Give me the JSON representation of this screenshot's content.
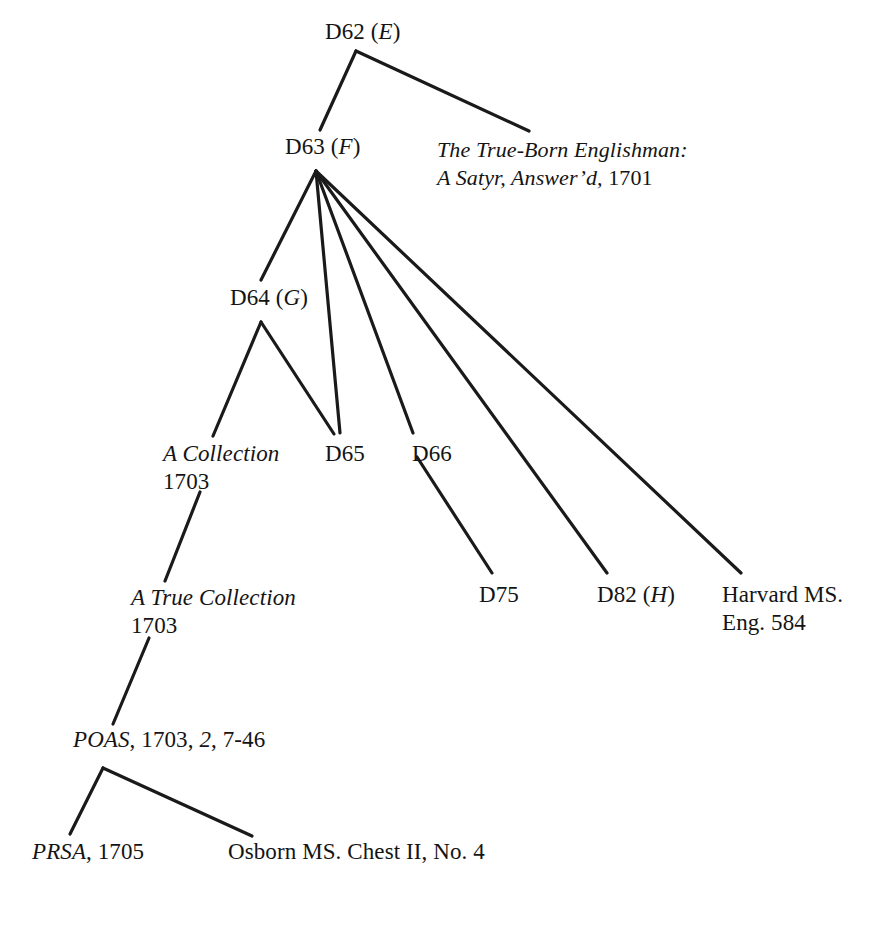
{
  "diagram": {
    "type": "stemma",
    "background_color": "#ffffff",
    "line_color": "#1a1a1a",
    "text_color": "#141414",
    "nodes": [
      {
        "id": "d62",
        "name": "node-d62",
        "lines": [
          {
            "parts": [
              {
                "text": "D62 (",
                "style": "roman"
              },
              {
                "text": "E",
                "style": "italic"
              },
              {
                "text": ")",
                "style": "roman"
              }
            ]
          }
        ],
        "plain": "D62 (E)",
        "x": 325,
        "y": 18
      },
      {
        "id": "d63",
        "name": "node-d63",
        "lines": [
          {
            "parts": [
              {
                "text": "D63 (",
                "style": "roman"
              },
              {
                "text": "F",
                "style": "italic"
              },
              {
                "text": ")",
                "style": "roman"
              }
            ]
          }
        ],
        "plain": "D63 (F)",
        "x": 285,
        "y": 133
      },
      {
        "id": "trueborn",
        "name": "node-true-born-englishman",
        "lines": [
          {
            "parts": [
              {
                "text": "The True-Born Englishman:",
                "style": "italic"
              }
            ]
          },
          {
            "parts": [
              {
                "text": "A Satyr, Answer’d,",
                "style": "italic"
              },
              {
                "text": " 1701",
                "style": "roman"
              }
            ]
          }
        ],
        "plain": "The True-Born Englishman: A Satyr, Answer’d, 1701",
        "x": 437,
        "y": 136
      },
      {
        "id": "d64",
        "name": "node-d64",
        "lines": [
          {
            "parts": [
              {
                "text": "D64 (",
                "style": "roman"
              },
              {
                "text": "G",
                "style": "italic"
              },
              {
                "text": ")",
                "style": "roman"
              }
            ]
          }
        ],
        "plain": "D64 (G)",
        "x": 230,
        "y": 284
      },
      {
        "id": "acollection",
        "name": "node-a-collection-1703",
        "lines": [
          {
            "parts": [
              {
                "text": "A Collection",
                "style": "italic"
              }
            ]
          },
          {
            "parts": [
              {
                "text": "1703",
                "style": "roman"
              }
            ]
          }
        ],
        "plain": "A Collection 1703",
        "x": 163,
        "y": 440
      },
      {
        "id": "d65",
        "name": "node-d65",
        "lines": [
          {
            "parts": [
              {
                "text": "D65",
                "style": "roman"
              }
            ]
          }
        ],
        "plain": "D65",
        "x": 325,
        "y": 440
      },
      {
        "id": "d66",
        "name": "node-d66",
        "lines": [
          {
            "parts": [
              {
                "text": "D66",
                "style": "roman"
              }
            ]
          }
        ],
        "plain": "D66",
        "x": 412,
        "y": 440
      },
      {
        "id": "atruecollection",
        "name": "node-a-true-collection-1703",
        "lines": [
          {
            "parts": [
              {
                "text": "A True Collection",
                "style": "italic"
              }
            ]
          },
          {
            "parts": [
              {
                "text": "1703",
                "style": "roman"
              }
            ]
          }
        ],
        "plain": "A True Collection 1703",
        "x": 131,
        "y": 584
      },
      {
        "id": "d75",
        "name": "node-d75",
        "lines": [
          {
            "parts": [
              {
                "text": "D75",
                "style": "roman"
              }
            ]
          }
        ],
        "plain": "D75",
        "x": 479,
        "y": 581
      },
      {
        "id": "d82",
        "name": "node-d82",
        "lines": [
          {
            "parts": [
              {
                "text": "D82 (",
                "style": "roman"
              },
              {
                "text": "H",
                "style": "italic"
              },
              {
                "text": ")",
                "style": "roman"
              }
            ]
          }
        ],
        "plain": "D82 (H)",
        "x": 597,
        "y": 581
      },
      {
        "id": "harvard",
        "name": "node-harvard-ms-eng-584",
        "lines": [
          {
            "parts": [
              {
                "text": "Harvard MS.",
                "style": "roman"
              }
            ]
          },
          {
            "parts": [
              {
                "text": "Eng. 584",
                "style": "roman"
              }
            ]
          }
        ],
        "plain": "Harvard MS. Eng. 584",
        "x": 722,
        "y": 581
      },
      {
        "id": "poas",
        "name": "node-poas-1703",
        "lines": [
          {
            "parts": [
              {
                "text": "POAS",
                "style": "italic"
              },
              {
                "text": ", 1703, ",
                "style": "roman"
              },
              {
                "text": "2",
                "style": "italic"
              },
              {
                "text": ", 7-46",
                "style": "roman"
              }
            ]
          }
        ],
        "plain": "POAS, 1703, 2, 7-46",
        "x": 73,
        "y": 726
      },
      {
        "id": "prsa",
        "name": "node-prsa-1705",
        "lines": [
          {
            "parts": [
              {
                "text": "PRSA",
                "style": "italic"
              },
              {
                "text": ", 1705",
                "style": "roman"
              }
            ]
          }
        ],
        "plain": "PRSA, 1705",
        "x": 32,
        "y": 838
      },
      {
        "id": "osborn",
        "name": "node-osborn-ms-chest-ii-no-4",
        "lines": [
          {
            "parts": [
              {
                "text": "Osborn MS. Chest II, No. 4",
                "style": "roman"
              }
            ]
          },
          {
            "parts": [
              {
                "text": "",
                "style": "roman"
              }
            ]
          }
        ],
        "plain": "Osborn MS. Chest II, No. 4",
        "x": 228,
        "y": 838
      }
    ],
    "edges": [
      {
        "name": "edge-d62-d63",
        "from": "d62",
        "to": "d63",
        "x1": 356,
        "y1": 51,
        "x2": 320,
        "y2": 130
      },
      {
        "name": "edge-d62-trueborn",
        "from": "d62",
        "to": "trueborn",
        "x1": 356,
        "y1": 51,
        "x2": 529,
        "y2": 131
      },
      {
        "name": "edge-d63-d64",
        "from": "d63",
        "to": "d64",
        "x1": 316,
        "y1": 171,
        "x2": 261,
        "y2": 280
      },
      {
        "name": "edge-d63-d65",
        "from": "d63",
        "to": "d65",
        "x1": 316,
        "y1": 171,
        "x2": 340,
        "y2": 433
      },
      {
        "name": "edge-d63-d66",
        "from": "d63",
        "to": "d66",
        "x1": 316,
        "y1": 171,
        "x2": 413,
        "y2": 433
      },
      {
        "name": "edge-d63-d82",
        "from": "d63",
        "to": "d82",
        "x1": 316,
        "y1": 171,
        "x2": 607,
        "y2": 573
      },
      {
        "name": "edge-d63-harvard",
        "from": "d63",
        "to": "harvard",
        "x1": 316,
        "y1": 171,
        "x2": 741,
        "y2": 573
      },
      {
        "name": "edge-d64-acollection",
        "from": "d64",
        "to": "acollection",
        "x1": 261,
        "y1": 322,
        "x2": 213,
        "y2": 436
      },
      {
        "name": "edge-d64-d65",
        "from": "d64",
        "to": "d65",
        "x1": 261,
        "y1": 322,
        "x2": 334,
        "y2": 434
      },
      {
        "name": "edge-acollection-atruecollection",
        "from": "acollection",
        "to": "atruecollection",
        "x1": 200,
        "y1": 492,
        "x2": 165,
        "y2": 581
      },
      {
        "name": "edge-atruecollection-poas",
        "from": "atruecollection",
        "to": "poas",
        "x1": 149,
        "y1": 638,
        "x2": 113,
        "y2": 724
      },
      {
        "name": "edge-d66-d75",
        "from": "d66",
        "to": "d75",
        "x1": 417,
        "y1": 457,
        "x2": 492,
        "y2": 573
      },
      {
        "name": "edge-poas-prsa",
        "from": "poas",
        "to": "prsa",
        "x1": 103,
        "y1": 768,
        "x2": 70,
        "y2": 834
      },
      {
        "name": "edge-poas-osborn",
        "from": "poas",
        "to": "osborn",
        "x1": 103,
        "y1": 768,
        "x2": 252,
        "y2": 836
      }
    ]
  }
}
